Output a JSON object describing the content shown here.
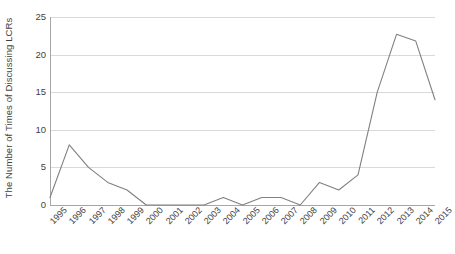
{
  "chart_data": {
    "type": "line",
    "title": "",
    "xlabel": "",
    "ylabel": "The Number of Times of Discussing LCRs",
    "categories": [
      "1995",
      "1996",
      "1997",
      "1998",
      "1999",
      "2000",
      "2001",
      "2002",
      "2003",
      "2004",
      "2005",
      "2006",
      "2007",
      "2008",
      "2009",
      "2010",
      "2011",
      "2012",
      "2013",
      "2014",
      "2015"
    ],
    "values": [
      1,
      8,
      5,
      3,
      2,
      0,
      0,
      0,
      0,
      1,
      0,
      1,
      1,
      0,
      3,
      2,
      4,
      15,
      22.7,
      21.8,
      14
    ],
    "series": [
      {
        "name": "Number of Times of Discussing LCRs",
        "values": [
          1,
          8,
          5,
          3,
          2,
          0,
          0,
          0,
          0,
          1,
          0,
          1,
          1,
          0,
          3,
          2,
          4,
          15,
          22.7,
          21.8,
          14
        ]
      }
    ],
    "ylim": [
      0,
      25
    ],
    "yticks": [
      0,
      5,
      10,
      15,
      20,
      25
    ],
    "ytick_labels": [
      "0",
      "5",
      "10",
      "15",
      "20",
      "25"
    ],
    "grid": true,
    "legend": false,
    "legend_position": "none",
    "line_color": "#808080",
    "gridline_color": "#d9d9d9",
    "axis_color": "#a6a6a6",
    "background_color": "#ffffff",
    "xtick_rotation": -45
  }
}
